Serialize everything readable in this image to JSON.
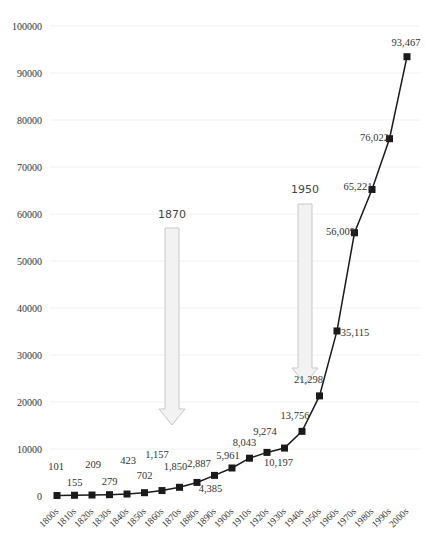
{
  "chart_data": {
    "type": "line",
    "title": "",
    "xlabel": "",
    "ylabel": "",
    "ylim": [
      0,
      100000
    ],
    "yticks": [
      "0",
      "10000",
      "20000",
      "30000",
      "40000",
      "50000",
      "60000",
      "70000",
      "80000",
      "90000",
      "100000"
    ],
    "grid": true,
    "legend": null,
    "categories": [
      "1800s",
      "1810s",
      "1820s",
      "1830s",
      "1840s",
      "1850s",
      "1860s",
      "1870s",
      "1880s",
      "1890s",
      "1900s",
      "1910s",
      "1920s",
      "1930s",
      "1940s",
      "1950s",
      "1960s",
      "1970s",
      "1980s",
      "1990s",
      "2000s"
    ],
    "series": [
      {
        "name": "",
        "values": [
          101,
          155,
          209,
          279,
          423,
          702,
          1157,
          1850,
          2887,
          4385,
          5961,
          8043,
          9274,
          10197,
          13756,
          21298,
          35115,
          56009,
          65221,
          76022,
          93467
        ],
        "labels": [
          "101",
          "155",
          "209",
          "279",
          "423",
          "702",
          "1,157",
          "1,850",
          "2,887",
          "4,385",
          "5,961",
          "8,043",
          "9,274",
          "10,197",
          "13,756",
          "21,298",
          "35,115",
          "56,009",
          "65,221",
          "76,022",
          "93,467"
        ],
        "color": "#1a1a1a",
        "marker": "square"
      }
    ],
    "annotations": [
      {
        "text": "1870",
        "type": "down-arrow",
        "category": "1870s"
      },
      {
        "text": "1950",
        "type": "down-arrow",
        "category": "1950s"
      }
    ]
  }
}
